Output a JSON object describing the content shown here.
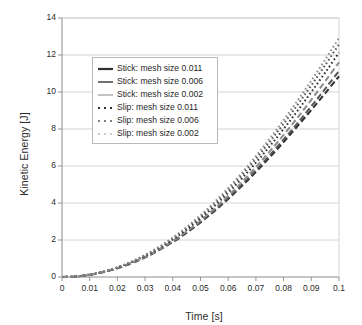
{
  "chart_data": {
    "type": "line",
    "title": "",
    "xlabel": "Time [s]",
    "ylabel": "Kinetic Energy [J]",
    "xlim": [
      0,
      0.1
    ],
    "ylim": [
      0,
      14
    ],
    "xticks": [
      "0",
      "0.01",
      "0.02",
      "0.03",
      "0.04",
      "0.05",
      "0.06",
      "0.07",
      "0.08",
      "0.09",
      "0.1"
    ],
    "yticks": [
      "0",
      "2",
      "4",
      "6",
      "8",
      "10",
      "12",
      "14"
    ],
    "xtick_values": [
      0,
      0.01,
      0.02,
      0.03,
      0.04,
      0.05,
      0.06,
      0.07,
      0.08,
      0.09,
      0.1
    ],
    "ytick_values": [
      0,
      2,
      4,
      6,
      8,
      10,
      12,
      14
    ],
    "grid": "horizontal",
    "legend_position": "upper left inside",
    "x": [
      0,
      0.005,
      0.01,
      0.015,
      0.02,
      0.025,
      0.03,
      0.035,
      0.04,
      0.045,
      0.05,
      0.055,
      0.06,
      0.065,
      0.07,
      0.075,
      0.08,
      0.085,
      0.09,
      0.095,
      0.1
    ],
    "series": [
      {
        "name": "Stick: mesh size 0.011",
        "style": "dashed",
        "color": "#2e2e2e",
        "values": [
          0,
          0.03,
          0.12,
          0.27,
          0.47,
          0.74,
          1.06,
          1.45,
          1.89,
          2.39,
          2.95,
          3.56,
          4.22,
          4.93,
          5.68,
          6.47,
          7.29,
          8.15,
          9.03,
          9.93,
          10.85
        ]
      },
      {
        "name": "Stick: mesh size 0.006",
        "style": "dashed",
        "color": "#555555",
        "values": [
          0,
          0.03,
          0.12,
          0.27,
          0.48,
          0.75,
          1.07,
          1.46,
          1.91,
          2.42,
          2.98,
          3.6,
          4.28,
          5.0,
          5.77,
          6.58,
          7.43,
          8.31,
          9.23,
          10.17,
          11.14
        ]
      },
      {
        "name": "Stick: mesh size 0.002",
        "style": "dashed",
        "color": "#8c8c8c",
        "values": [
          0,
          0.03,
          0.12,
          0.28,
          0.49,
          0.76,
          1.09,
          1.49,
          1.95,
          2.47,
          3.05,
          3.69,
          4.39,
          5.14,
          5.94,
          6.79,
          7.68,
          8.61,
          9.58,
          10.58,
          11.61
        ]
      },
      {
        "name": "Slip: mesh size 0.011",
        "style": "dotted",
        "color": "#2e2e2e",
        "values": [
          0,
          0.03,
          0.13,
          0.29,
          0.51,
          0.79,
          1.14,
          1.55,
          2.02,
          2.56,
          3.17,
          3.83,
          4.56,
          5.34,
          6.18,
          7.07,
          8.0,
          8.98,
          10.0,
          11.05,
          12.13
        ]
      },
      {
        "name": "Slip: mesh size 0.006",
        "style": "dotted",
        "color": "#555555",
        "values": [
          0,
          0.03,
          0.13,
          0.3,
          0.52,
          0.82,
          1.18,
          1.6,
          2.09,
          2.65,
          3.27,
          3.96,
          4.71,
          5.52,
          6.39,
          7.31,
          8.28,
          9.3,
          10.36,
          11.45,
          12.58
        ]
      },
      {
        "name": "Slip: mesh size 0.002",
        "style": "dotted",
        "color": "#8c8c8c",
        "values": [
          0,
          0.03,
          0.13,
          0.3,
          0.53,
          0.83,
          1.2,
          1.63,
          2.13,
          2.7,
          3.34,
          4.04,
          4.81,
          5.64,
          6.53,
          7.48,
          8.48,
          9.53,
          10.62,
          11.75,
          12.92
        ]
      }
    ]
  },
  "legend": {
    "items": [
      {
        "label": "Stick: mesh size 0.011",
        "style": "solid",
        "color": "#2e2e2e",
        "width": 2.2
      },
      {
        "label": "Stick: mesh size 0.006",
        "style": "solid",
        "color": "#555555",
        "width": 1.7
      },
      {
        "label": "Stick: mesh size 0.002",
        "style": "solid",
        "color": "#9a9a9a",
        "width": 1.2
      },
      {
        "label": "Slip: mesh size 0.011",
        "style": "dotted",
        "color": "#2e2e2e",
        "width": 2.2
      },
      {
        "label": "Slip: mesh size 0.006",
        "style": "dotted",
        "color": "#555555",
        "width": 1.7
      },
      {
        "label": "Slip: mesh size 0.002",
        "style": "dotted",
        "color": "#9a9a9a",
        "width": 1.2
      }
    ]
  },
  "colors": {
    "axis": "#8a8a8a",
    "grid": "#cfcfcf",
    "text": "#2b2b2b",
    "background": "#ffffff"
  }
}
